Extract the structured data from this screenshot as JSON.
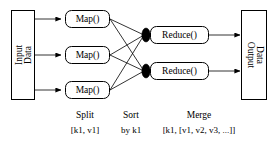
{
  "diagram": {
    "background_color": "#ffffff",
    "line_color": "#000000",
    "node_fill": "#ffffff",
    "marker_color": "#000000",
    "input_node": {
      "label_line1": "Input",
      "label_line2": "Data",
      "orientation": "rotated-90-ccw"
    },
    "output_node": {
      "label_line1": "Output",
      "label_line2": "Data",
      "orientation": "rotated-90-cw"
    },
    "map_nodes": [
      {
        "label": "Map()"
      },
      {
        "label": "Map()"
      },
      {
        "label": "Map()"
      }
    ],
    "reduce_nodes": [
      {
        "label": "Reduce()"
      },
      {
        "label": "Reduce()"
      }
    ],
    "stage_labels": [
      {
        "name": "Split",
        "detail": "[k1, v1]"
      },
      {
        "name": "Sort",
        "detail": "by k1"
      },
      {
        "name": "Merge",
        "detail": "[k1, [v1, v2, v3, ...]]"
      }
    ]
  }
}
